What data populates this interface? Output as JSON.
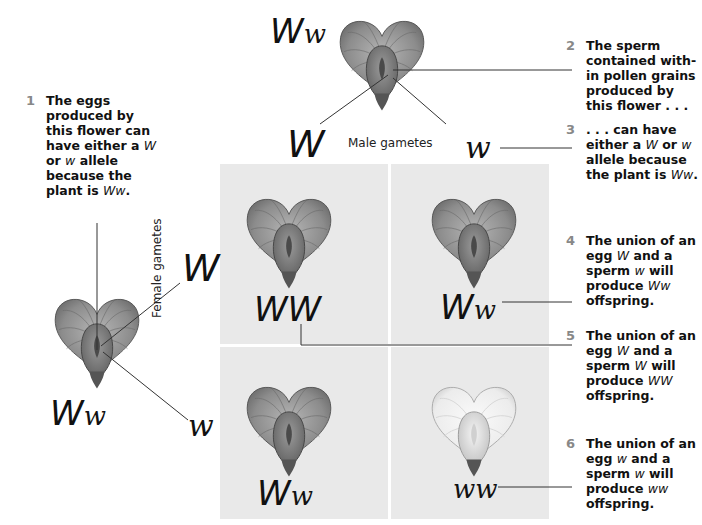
{
  "diagram": {
    "type": "punnett-square",
    "cross": "Ww x Ww"
  },
  "male_parent": {
    "genotype_dominant": "W",
    "genotype_recessive": "w"
  },
  "female_parent": {
    "genotype_dominant": "W",
    "genotype_recessive": "w"
  },
  "labels": {
    "male_gametes": "Male gametes",
    "female_gametes": "Female gametes"
  },
  "male_alleles": [
    "W",
    "w"
  ],
  "female_alleles": [
    "W",
    "w"
  ],
  "offspring": [
    {
      "row": 0,
      "col": 0,
      "genotype_a": "WW",
      "genotype_b": "",
      "flower_color": "dark"
    },
    {
      "row": 0,
      "col": 1,
      "genotype_a": "W",
      "genotype_b": "w",
      "flower_color": "dark"
    },
    {
      "row": 1,
      "col": 0,
      "genotype_a": "W",
      "genotype_b": "w",
      "flower_color": "dark"
    },
    {
      "row": 1,
      "col": 1,
      "genotype_a": "",
      "genotype_b": "ww",
      "flower_color": "white"
    }
  ],
  "notes": [
    {
      "num": "1",
      "parts": [
        "The eggs produced by this flower can have either a ",
        "W",
        " or ",
        "w",
        " allele because the plant is ",
        "Ww",
        "."
      ]
    },
    {
      "num": "2",
      "parts": [
        "The sperm contained with-in pollen grains produced by this flower . . ."
      ]
    },
    {
      "num": "3",
      "parts": [
        ". . . can have either a ",
        "W",
        " or ",
        "w",
        " allele because the plant is ",
        "Ww",
        "."
      ]
    },
    {
      "num": "4",
      "parts": [
        "The union of an egg ",
        "W",
        " and a sperm ",
        "w",
        " will produce ",
        "Ww",
        " offspring."
      ]
    },
    {
      "num": "5",
      "parts": [
        "The union of an egg ",
        "W",
        " and a sperm ",
        "W",
        " will produce ",
        "WW",
        " offspring."
      ]
    },
    {
      "num": "6",
      "parts": [
        "The union of an egg ",
        "w",
        " and a sperm ",
        "w",
        " will produce ",
        "ww",
        " offspring."
      ]
    }
  ],
  "colors": {
    "grid_bg": "#e9e9e9",
    "grid_divider": "#ffffff",
    "note_number": "#888888",
    "leader_line": "#333333",
    "flower_dark": "#8a8a8a",
    "flower_white": "#f2f2f2"
  }
}
